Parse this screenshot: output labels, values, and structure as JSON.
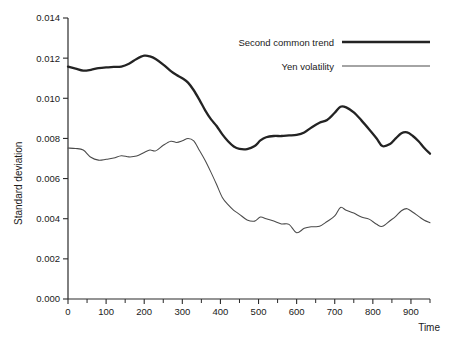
{
  "chart_data": {
    "type": "line",
    "title": "",
    "xlabel": "Time",
    "ylabel": "Standard deviation",
    "xlim": [
      0,
      950
    ],
    "ylim": [
      0.0,
      0.014
    ],
    "grid": false,
    "legend_position": "top-right",
    "x_ticks": [
      0,
      100,
      200,
      300,
      400,
      500,
      600,
      700,
      800,
      900
    ],
    "x_tick_labels": [
      "0",
      "100",
      "200",
      "300",
      "400",
      "500",
      "600",
      "700",
      "800",
      "900"
    ],
    "x_minor_ticks": [
      50,
      150,
      250,
      350,
      450,
      550,
      650,
      750,
      850,
      950
    ],
    "y_ticks": [
      0.0,
      0.002,
      0.004,
      0.006,
      0.008,
      0.01,
      0.012,
      0.014
    ],
    "y_tick_labels": [
      "0.000",
      "0.002",
      "0.004",
      "0.006",
      "0.008",
      "0.010",
      "0.012",
      "0.014"
    ],
    "x": [
      0,
      20,
      40,
      60,
      80,
      100,
      120,
      140,
      160,
      180,
      200,
      215,
      230,
      250,
      270,
      285,
      300,
      315,
      330,
      345,
      360,
      375,
      390,
      405,
      420,
      435,
      450,
      470,
      490,
      505,
      520,
      540,
      560,
      580,
      600,
      620,
      640,
      660,
      680,
      700,
      715,
      730,
      750,
      770,
      790,
      810,
      825,
      845,
      860,
      875,
      890,
      905,
      920,
      935,
      950
    ],
    "series": [
      {
        "name": "Second common trend",
        "line_width": "thick",
        "color": "#232323",
        "values": [
          0.01158,
          0.01148,
          0.01138,
          0.01142,
          0.0115,
          0.01154,
          0.01156,
          0.01158,
          0.01172,
          0.01196,
          0.01212,
          0.01209,
          0.01196,
          0.01168,
          0.01135,
          0.01116,
          0.011,
          0.01078,
          0.0104,
          0.00992,
          0.0094,
          0.00896,
          0.00862,
          0.0082,
          0.00786,
          0.0076,
          0.00748,
          0.00747,
          0.00762,
          0.0079,
          0.00806,
          0.00812,
          0.00812,
          0.00815,
          0.00818,
          0.0083,
          0.00856,
          0.00878,
          0.00892,
          0.00928,
          0.00958,
          0.00955,
          0.0093,
          0.0089,
          0.00846,
          0.008,
          0.00762,
          0.00772,
          0.008,
          0.00826,
          0.0083,
          0.00812,
          0.00786,
          0.00752,
          0.00724
        ]
      },
      {
        "name": "Yen volatility",
        "line_width": "thin",
        "color": "#4a4a4a",
        "values": [
          0.00752,
          0.0075,
          0.00742,
          0.00706,
          0.00692,
          0.00696,
          0.00702,
          0.00714,
          0.00708,
          0.00712,
          0.0073,
          0.00742,
          0.00738,
          0.00766,
          0.00786,
          0.0078,
          0.00788,
          0.008,
          0.00788,
          0.0074,
          0.0069,
          0.00632,
          0.0057,
          0.00506,
          0.0047,
          0.00442,
          0.00422,
          0.00394,
          0.00388,
          0.00408,
          0.004,
          0.00388,
          0.00374,
          0.00372,
          0.0033,
          0.00352,
          0.0036,
          0.00362,
          0.00386,
          0.00414,
          0.00456,
          0.00442,
          0.00428,
          0.00408,
          0.00398,
          0.00372,
          0.00362,
          0.0039,
          0.00412,
          0.0044,
          0.0045,
          0.00432,
          0.00412,
          0.00392,
          0.0038
        ]
      }
    ]
  },
  "legend": {
    "entries": [
      {
        "label": "Second common trend",
        "style": "thick"
      },
      {
        "label": "Yen volatility",
        "style": "thin"
      }
    ]
  }
}
